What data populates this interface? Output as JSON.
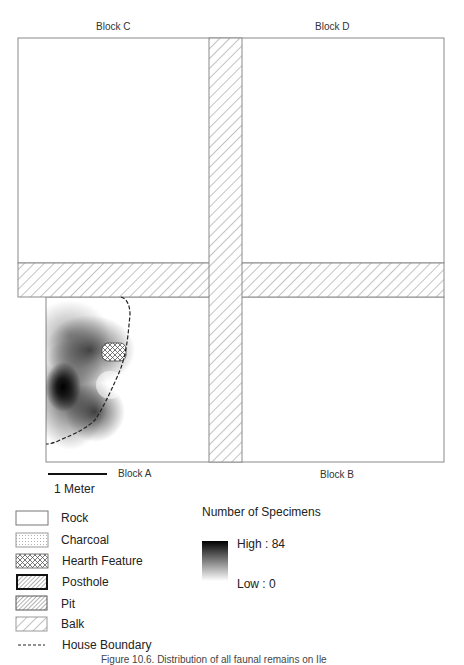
{
  "map": {
    "blocks": [
      {
        "id": "C",
        "label": "Block C"
      },
      {
        "id": "D",
        "label": "Block D"
      },
      {
        "id": "A",
        "label": "Block A"
      },
      {
        "id": "B",
        "label": "Block B"
      }
    ],
    "scale_bar": {
      "label": "1 Meter"
    },
    "colors": {
      "outline": "#8a8a8a",
      "hatch": "#8a8a8a",
      "density_high": "#000000",
      "density_low": "#ffffff"
    }
  },
  "legend": {
    "items": [
      {
        "name": "rock",
        "label": "Rock"
      },
      {
        "name": "charcoal",
        "label": "Charcoal"
      },
      {
        "name": "hearth-feature",
        "label": "Hearth Feature"
      },
      {
        "name": "posthole",
        "label": "Posthole"
      },
      {
        "name": "pit",
        "label": "Pit"
      },
      {
        "name": "balk",
        "label": "Balk"
      },
      {
        "name": "house-boundary",
        "label": "House Boundary"
      }
    ],
    "density": {
      "title": "Number of Specimens",
      "high": "High : 84",
      "low": "Low : 0"
    }
  },
  "caption": "Figure 10.6. Distribution of all faunal remains on Ile"
}
